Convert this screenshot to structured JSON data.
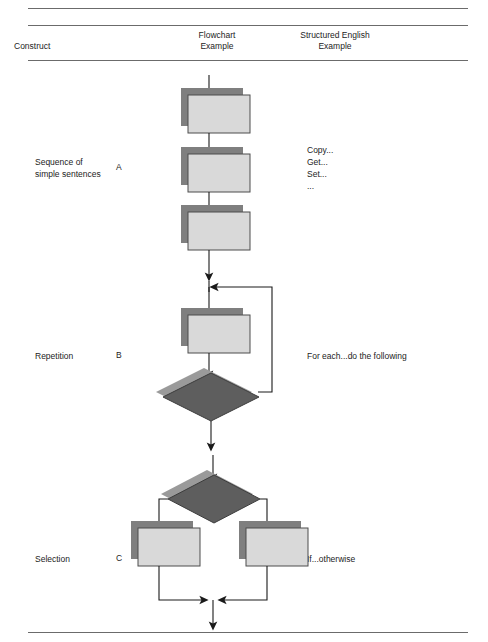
{
  "figure": {
    "headers": {
      "construct": "Construct",
      "flowchart_example": "Flowchart\nExample",
      "structured_english_example": "Structured English\nExample"
    },
    "rows": [
      {
        "key": "A",
        "construct": "Sequence of\nsimple sentences",
        "structured_english": "Copy...\nGet...\nSet...\n...",
        "flowchart": {
          "type": "sequence",
          "nodes": [
            "process",
            "process",
            "process"
          ],
          "arrows": 4
        }
      },
      {
        "key": "B",
        "construct": "Repetition",
        "structured_english": "For each...do the following",
        "flowchart": {
          "type": "loop",
          "nodes": [
            "process",
            "decision"
          ],
          "loop_back": true
        }
      },
      {
        "key": "C",
        "construct": "Selection",
        "structured_english": "If...otherwise",
        "flowchart": {
          "type": "branch",
          "nodes": [
            "decision",
            "process",
            "process"
          ],
          "merge": true
        }
      }
    ],
    "colors": {
      "process_fill": "#d9d9d9",
      "process_shadow": "#7f7f7f",
      "process_stroke": "#4d4d4d",
      "decision_fill": "#5e5e5e",
      "decision_shadow": "#9a9a9a",
      "decision_stroke": "#3c3c3c",
      "line": "#1a1a1a",
      "rule": "#6b6b6b",
      "text": "#232323",
      "background": "#ffffff"
    }
  }
}
